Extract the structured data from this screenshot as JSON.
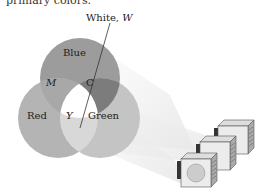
{
  "header": {
    "clipped_text": "primary colors."
  },
  "labels": {
    "white": "White, ",
    "white_var": "W",
    "blue": "Blue",
    "magenta": "M",
    "cyan": "C",
    "red": "Red",
    "yellow": "Y",
    "green": "Green"
  },
  "colors": {
    "blue": "#9c9c9c",
    "red": "#b4b4b4",
    "green": "#c4c4c4",
    "magenta": "#a8a8a8",
    "cyan": "#7c7c7c",
    "yellow": "#d8d8d8",
    "white": "#ffffff"
  },
  "projectors": {
    "count": 3
  }
}
